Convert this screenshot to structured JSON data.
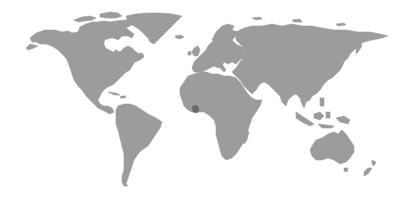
{
  "map": {
    "type": "world-choropleth",
    "projection": "equirectangular-like",
    "background_color": "#ffffff",
    "land_color": "#9c9c9c",
    "highlight_color": "#6a6a6a",
    "regions": [
      {
        "name": "North America",
        "highlighted": false
      },
      {
        "name": "Greenland",
        "highlighted": false
      },
      {
        "name": "South America",
        "highlighted": false
      },
      {
        "name": "Europe",
        "highlighted": false
      },
      {
        "name": "Africa",
        "highlighted": false
      },
      {
        "name": "Asia",
        "highlighted": false
      },
      {
        "name": "Australia",
        "highlighted": false
      },
      {
        "name": "New Zealand",
        "highlighted": false
      },
      {
        "name": "Madagascar",
        "highlighted": false
      },
      {
        "name": "Indonesia",
        "highlighted": false
      },
      {
        "name": "Japan",
        "highlighted": false
      },
      {
        "name": "United Kingdom",
        "highlighted": false
      },
      {
        "name": "Iceland",
        "highlighted": false
      }
    ],
    "highlighted_region": {
      "name": "Ghana",
      "approx_pixel_center": [
        195,
        109
      ]
    }
  }
}
